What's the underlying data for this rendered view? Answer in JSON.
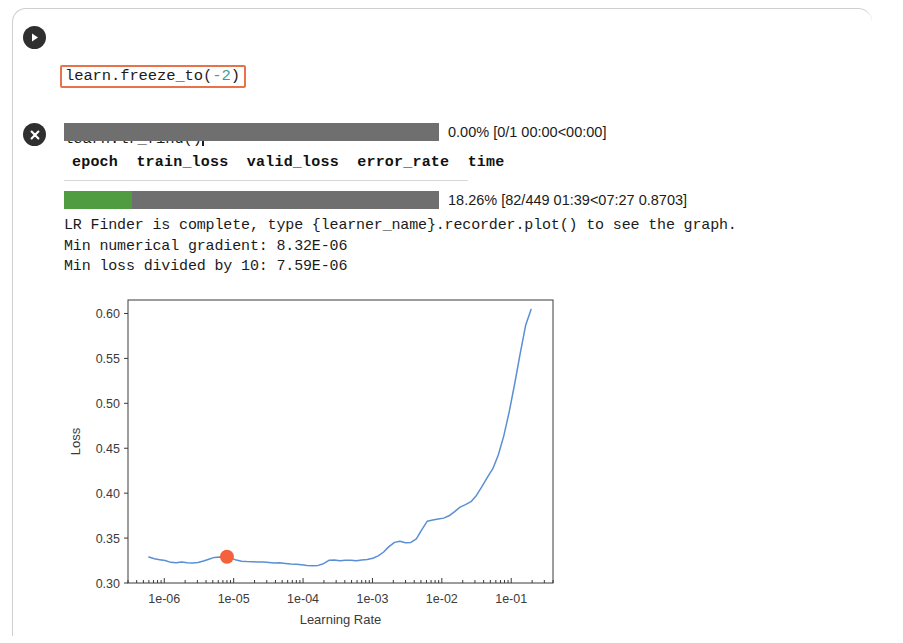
{
  "cell": {
    "run_button_icon": "play-icon",
    "stop_button_icon": "close-icon",
    "code_lines": [
      {
        "prefix": "learn.freeze_to(",
        "token": "-2",
        "token_type": "number",
        "suffix": ")",
        "highlighted": true
      },
      {
        "prefix": "learn.lr_find()",
        "token": "",
        "token_type": "",
        "suffix": "",
        "highlighted": false
      },
      {
        "prefix": "learn.recorder.plot(suggestion=",
        "token": "True",
        "token_type": "bool",
        "suffix": ")",
        "highlighted": false
      }
    ],
    "highlight_color": "#e8734a",
    "number_color": "#3f9b8e",
    "bool_color": "#6f6fd4"
  },
  "output": {
    "progress_bars": [
      {
        "percent_label": "0.00%",
        "detail": "[0/1 00:00<00:00]",
        "text": "0.00% [0/1 00:00<00:00]",
        "fill_percent": 0,
        "track_color": "#6f6f6f",
        "fill_color": "#4f9c41"
      },
      {
        "percent_label": "18.26%",
        "detail": "[82/449 01:39<07:27 0.8703]",
        "text": "18.26% [82/449 01:39<07:27 0.8703]",
        "fill_percent": 18.26,
        "track_color": "#6f6f6f",
        "fill_color": "#4f9c41"
      }
    ],
    "metrics_columns": [
      "epoch",
      "train_loss",
      "valid_loss",
      "error_rate",
      "time"
    ],
    "metrics_header_text": "epoch  train_loss  valid_loss  error_rate  time",
    "metrics_rows": [],
    "text_lines": [
      "LR Finder is complete, type {learner_name}.recorder.plot() to see the graph.",
      "Min numerical gradient: 8.32E-06",
      "Min loss divided by 10: 7.59E-06"
    ]
  },
  "chart_data": {
    "type": "line",
    "title": "",
    "xlabel": "Learning Rate",
    "ylabel": "Loss",
    "xscale": "log",
    "xlim": [
      3e-07,
      0.4
    ],
    "ylim": [
      0.3,
      0.615
    ],
    "yticks": [
      0.3,
      0.35,
      0.4,
      0.45,
      0.5,
      0.55,
      0.6
    ],
    "ytick_labels": [
      "0.30",
      "0.35",
      "0.40",
      "0.45",
      "0.50",
      "0.55",
      "0.60"
    ],
    "xticks": [
      1e-06,
      1e-05,
      0.0001,
      0.001,
      0.01,
      0.1
    ],
    "xtick_labels": [
      "1e-06",
      "1e-05",
      "1e-04",
      "1e-03",
      "1e-02",
      "1e-01"
    ],
    "grid": false,
    "legend": false,
    "line_color": "#5b8fd4",
    "marker_color": "#f4613c",
    "series": [
      {
        "name": "loss",
        "x": [
          6e-07,
          7.2e-07,
          8.6e-07,
          1.03e-06,
          1.24e-06,
          1.48e-06,
          1.78e-06,
          2.13e-06,
          2.55e-06,
          3.06e-06,
          3.67e-06,
          4.39e-06,
          5.27e-06,
          6.31e-06,
          7.57e-06,
          9.07e-06,
          1.09e-05,
          1.3e-05,
          1.56e-05,
          1.87e-05,
          2.24e-05,
          2.69e-05,
          3.22e-05,
          3.86e-05,
          4.63e-05,
          5.55e-05,
          6.65e-05,
          7.97e-05,
          9.55e-05,
          0.000114,
          0.000137,
          0.000165,
          0.000197,
          0.000236,
          0.000283,
          0.000339,
          0.000407,
          0.000488,
          0.000585,
          0.000701,
          0.00084,
          0.00101,
          0.00121,
          0.00145,
          0.00173,
          0.00208,
          0.00249,
          0.00299,
          0.00358,
          0.00429,
          0.00515,
          0.00617,
          0.0074,
          0.00886,
          0.0106,
          0.0127,
          0.0153,
          0.0183,
          0.0219,
          0.0263,
          0.0315,
          0.0378,
          0.0453,
          0.0543,
          0.0651,
          0.078,
          0.0935,
          0.112,
          0.134,
          0.161,
          0.193
        ],
        "y": [
          0.329,
          0.327,
          0.326,
          0.325,
          0.323,
          0.3225,
          0.3235,
          0.3225,
          0.3222,
          0.3228,
          0.3245,
          0.3265,
          0.3285,
          0.329,
          0.3288,
          0.3278,
          0.3255,
          0.3242,
          0.3238,
          0.3236,
          0.3234,
          0.3233,
          0.3228,
          0.3222,
          0.3225,
          0.3218,
          0.3212,
          0.3208,
          0.3202,
          0.3196,
          0.3192,
          0.3196,
          0.3215,
          0.3252,
          0.3256,
          0.3248,
          0.3254,
          0.3252,
          0.3249,
          0.3256,
          0.3262,
          0.3275,
          0.3302,
          0.3345,
          0.3405,
          0.3452,
          0.3465,
          0.3448,
          0.3452,
          0.3492,
          0.3595,
          0.3688,
          0.3702,
          0.3712,
          0.3722,
          0.3748,
          0.3795,
          0.3845,
          0.3872,
          0.3905,
          0.3975,
          0.4072,
          0.4175,
          0.4272,
          0.4425,
          0.4635,
          0.4905,
          0.5215,
          0.5545,
          0.5865,
          0.6045
        ]
      }
    ],
    "markers": [
      {
        "name": "suggested-lr",
        "x": 8e-06,
        "y": 0.3292,
        "color": "#f4613c",
        "radius": 7
      }
    ]
  }
}
